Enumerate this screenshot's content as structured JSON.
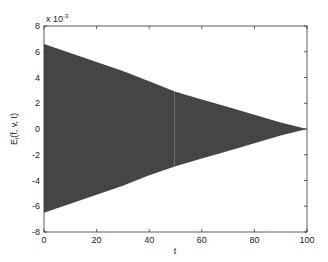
{
  "chart_data": {
    "type": "area",
    "title": "",
    "xlabel": "t",
    "ylabel": "E_l(f, v, t)",
    "y_exponent_label": "x 10",
    "y_exponent": "-3",
    "xlim": [
      0,
      100
    ],
    "ylim": [
      -8,
      8
    ],
    "y_scale": 0.001,
    "grid": false,
    "x_ticks": [
      "0",
      "20",
      "40",
      "60",
      "80",
      "100"
    ],
    "y_ticks": [
      "8",
      "6",
      "4",
      "2",
      "0",
      "-2",
      "-4",
      "-6",
      "-8"
    ],
    "fill_color": "#454545",
    "envelope": {
      "t": [
        0,
        10,
        20,
        30,
        40,
        50,
        60,
        70,
        80,
        90,
        100
      ],
      "upper": [
        6.6,
        5.9,
        5.2,
        4.5,
        3.7,
        2.9,
        2.3,
        1.7,
        1.1,
        0.5,
        0.0
      ],
      "lower": [
        -6.5,
        -5.8,
        -5.1,
        -4.4,
        -3.6,
        -2.9,
        -2.3,
        -1.7,
        -1.1,
        -0.5,
        0.0
      ]
    }
  }
}
